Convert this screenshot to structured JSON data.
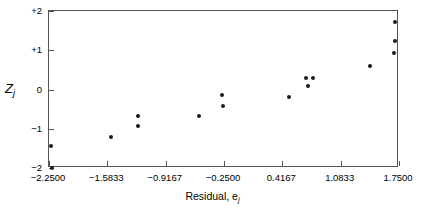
{
  "chart_data": {
    "type": "scatter",
    "title": "",
    "xlabel": "Residual, e",
    "xlabel_sub": "j",
    "ylabel": "Z",
    "ylabel_sub": "j",
    "xlim": [
      -2.25,
      1.75
    ],
    "ylim": [
      -2,
      2
    ],
    "grid": false,
    "legend": null,
    "xticks": [
      -2.25,
      -1.5833,
      -0.9167,
      -0.25,
      0.4167,
      1.0833,
      1.75
    ],
    "xtick_labels": [
      "-2.2500",
      "-1.5833",
      "-0.9167",
      "-0.2500",
      "0.4167",
      "1.0833",
      "1.7500"
    ],
    "yticks": [
      2,
      1,
      0,
      -1,
      -2
    ],
    "ytick_labels": [
      "+2",
      "+1",
      "0",
      "-1",
      "-2"
    ],
    "marker": "filled-circle",
    "marker_color": "#1a1a1a",
    "points": [
      {
        "x": -2.2286,
        "y": -1.4359
      },
      {
        "x": -2.2171,
        "y": -2.0
      },
      {
        "x": -1.5371,
        "y": -1.2051
      },
      {
        "x": -1.2286,
        "y": -0.6667
      },
      {
        "x": -1.2286,
        "y": -0.9231
      },
      {
        "x": -0.5314,
        "y": -0.6667
      },
      {
        "x": -0.2686,
        "y": -0.1282
      },
      {
        "x": -0.2571,
        "y": -0.4103
      },
      {
        "x": 0.4971,
        "y": -0.1795
      },
      {
        "x": 0.6914,
        "y": 0.2821
      },
      {
        "x": 0.7143,
        "y": 0.0769
      },
      {
        "x": 0.7714,
        "y": 0.2821
      },
      {
        "x": 1.4229,
        "y": 0.5897
      },
      {
        "x": 1.7086,
        "y": 1.7179
      },
      {
        "x": 1.7086,
        "y": 1.2308
      },
      {
        "x": 1.6971,
        "y": 0.9231
      }
    ]
  },
  "axis_frame": {
    "border_color": "#555555",
    "background": "#ffffff"
  }
}
